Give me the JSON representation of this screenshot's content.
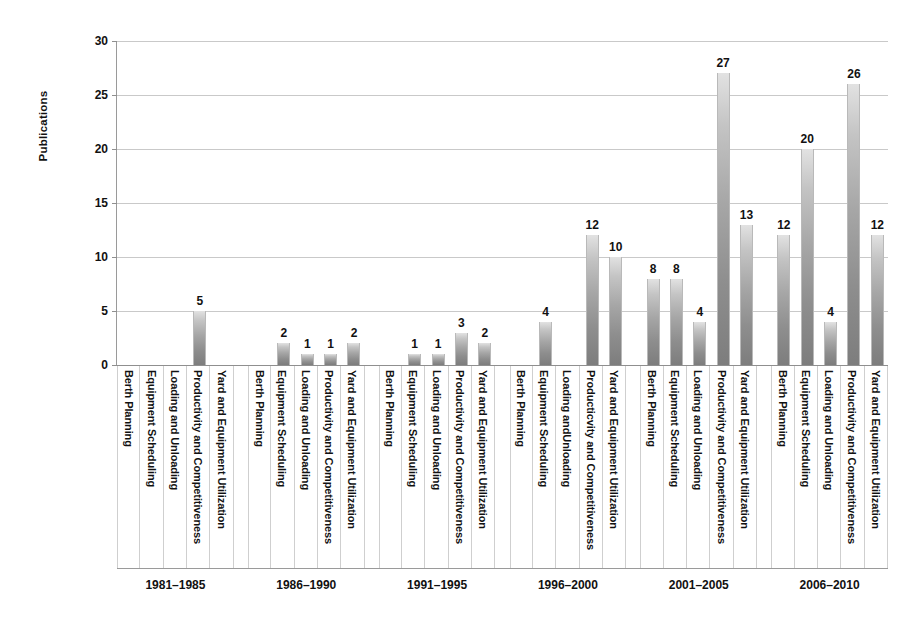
{
  "chart_data": {
    "type": "bar",
    "title": "",
    "subtitle": "",
    "xlabel": "",
    "ylabel": "Publications",
    "ylim": [
      0,
      30
    ],
    "ytick_values": [
      0,
      5,
      10,
      15,
      20,
      25,
      30
    ],
    "ytick_labels": [
      "0",
      "5",
      "10",
      "15",
      "20",
      "25",
      "30"
    ],
    "grid": true,
    "legend": false,
    "legend_position": "none",
    "orientation": "vertical",
    "categories": [
      "Berth Planning",
      "Equipment Scheduling",
      "Loading and Unloading",
      "Productivity and Competitiveness",
      "Yard and Equipment Utilization"
    ],
    "groups": [
      {
        "period": "1981–1985",
        "tick_labels": [
          "Berth Planning",
          "Equipment Scheduling",
          "Loading and Unloading",
          "Productivity and Competitiveness",
          "Yard and Equipment Utilization"
        ],
        "values": [
          0,
          0,
          0,
          5,
          0
        ],
        "value_labels": [
          "",
          "",
          "",
          "5",
          ""
        ]
      },
      {
        "period": "1986–1990",
        "tick_labels": [
          "Berth Planning",
          "Equipment Scheduling",
          "Loading and Unloading",
          "Productivity and Competitiveness",
          "Yard and Equipment Utilization"
        ],
        "values": [
          0,
          2,
          1,
          1,
          2
        ],
        "value_labels": [
          "",
          "2",
          "1",
          "1",
          "2"
        ]
      },
      {
        "period": "1991–1995",
        "tick_labels": [
          "Berth Planning",
          "Equipment Scheduling",
          "Loading and Unloading",
          "Productivity and Competitiveness",
          "Yard and Equipment Utilization"
        ],
        "values": [
          0,
          1,
          1,
          3,
          2
        ],
        "value_labels": [
          "",
          "1",
          "1",
          "3",
          "2"
        ]
      },
      {
        "period": "1996–2000",
        "tick_labels": [
          "Berth Planning",
          "Equipment Scheduling",
          "Loading andUnloading",
          "Producticvity and Competitiveness",
          "Yard and Equipment Utilization"
        ],
        "values": [
          0,
          4,
          0,
          12,
          10
        ],
        "value_labels": [
          "",
          "4",
          "",
          "12",
          "10"
        ]
      },
      {
        "period": "2001–2005",
        "tick_labels": [
          "Berth Planning",
          "Equipment Scheduling",
          "Loading and Unloading",
          "Productivity and Competitiveness",
          "Yard and Equipment Utilization"
        ],
        "values": [
          8,
          8,
          4,
          27,
          13
        ],
        "value_labels": [
          "8",
          "8",
          "4",
          "27",
          "13"
        ]
      },
      {
        "period": "2006–2010",
        "tick_labels": [
          "Berth Planning",
          "Equipment Scheduling",
          "Loading and Unloading",
          "Productivity and Competitiveness",
          "Yard and Equipment Utilization"
        ],
        "values": [
          12,
          20,
          4,
          26,
          12
        ],
        "value_labels": [
          "12",
          "20",
          "4",
          "26",
          "12"
        ]
      }
    ],
    "colors": {
      "bar_top": "#e2e2e2",
      "bar_bottom": "#7d7d7d",
      "gridline": "#c9c9c9",
      "axis": "#8f8f8f",
      "text": "#111111",
      "background": "#ffffff"
    }
  }
}
